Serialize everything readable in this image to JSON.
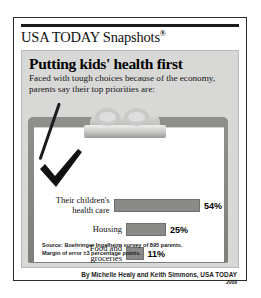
{
  "masthead": {
    "title": "USA TODAY Snapshots",
    "registered_mark": "®"
  },
  "headline": "Putting kids' health first",
  "subhead": "Faced with tough choices because of the economy, parents say their top priorities are:",
  "illustration": {
    "clipboard": "clipboard",
    "check": "checkmark",
    "pen": "pen-stroke"
  },
  "source_line_1": "Source: Boehringer Ingelheim survey of 895 parents.",
  "source_line_2": "Margin of error ±3 percentage points.",
  "byline": "By Michelle Healy and Keith Simmons, USA TODAY",
  "year": "2009",
  "colors": {
    "panel_bg": "#d8d8d6",
    "bar_fill": "#8a8a88",
    "clipboard_body": "#8f8f8d",
    "rule": "#1a1a1a"
  },
  "chart_data": {
    "type": "bar",
    "orientation": "horizontal",
    "title": "Putting kids' health first",
    "subtitle": "Faced with tough choices because of the economy, parents say their top priorities are:",
    "xlabel": "",
    "ylabel": "",
    "xlim": [
      0,
      60
    ],
    "grid": false,
    "legend": "none",
    "categories": [
      "Their children's health care",
      "Housing",
      "Food and groceries",
      "Their own or spouse/ partner's health care",
      "Other"
    ],
    "values": [
      54,
      25,
      11,
      6,
      6
    ],
    "value_labels": [
      "54%",
      "25%",
      "11%",
      "6%",
      "6%"
    ],
    "label_lines": [
      [
        "Their children's",
        "health care"
      ],
      [
        "Housing"
      ],
      [
        "Food and",
        "groceries"
      ],
      [
        "Their own or spouse/",
        "partner's health care"
      ],
      [
        "Other"
      ]
    ],
    "source": "Source: Boehringer Ingelheim survey of 895 parents. Margin of error ±3 percentage points."
  }
}
